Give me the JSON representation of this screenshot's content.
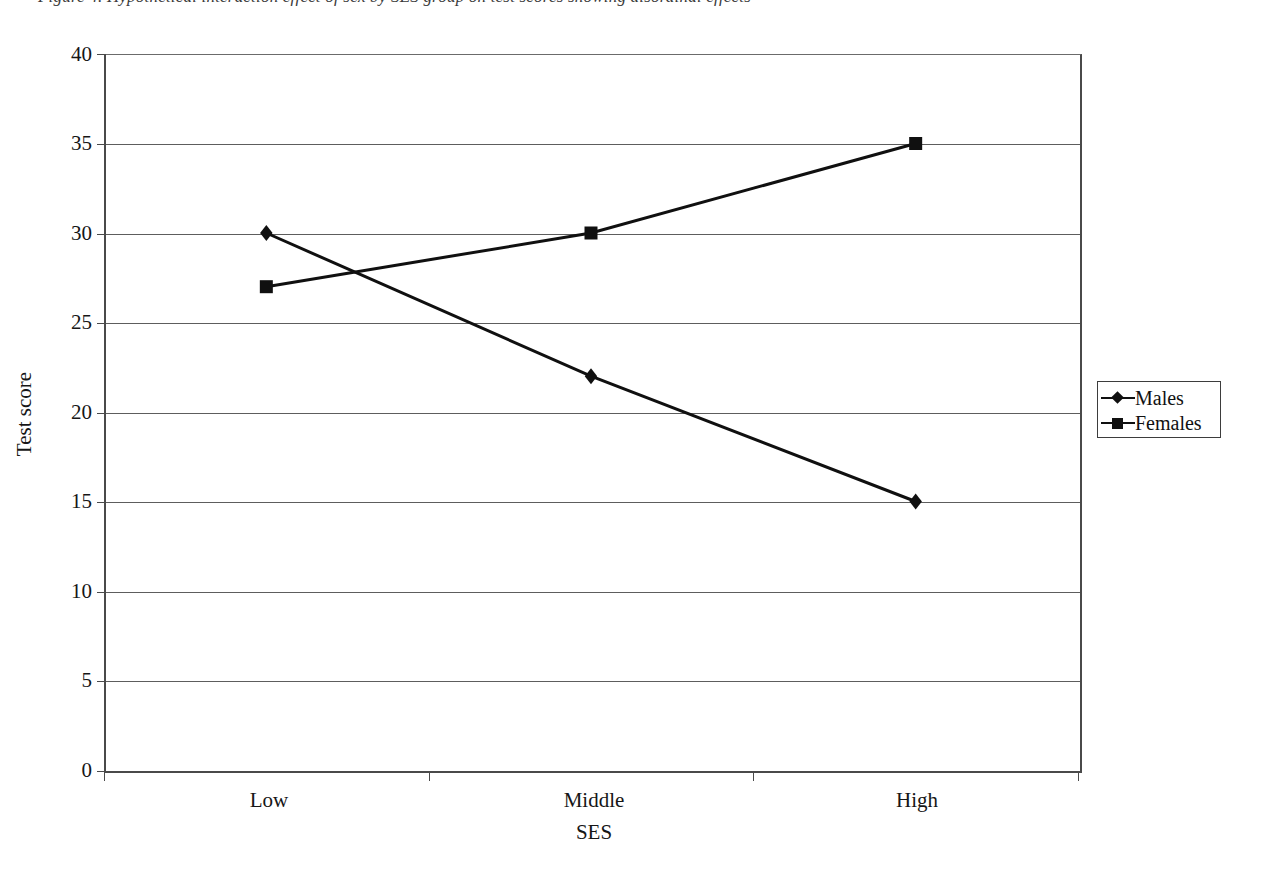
{
  "figure": {
    "top_caption_clipped": "Figure 4. Hypothetical interaction effect of sex by SES group on test scores showing disordinal effects"
  },
  "legend": {
    "position": "right",
    "entries": [
      {
        "label": "Males",
        "marker": "diamond-marker-icon",
        "color": "#101010"
      },
      {
        "label": "Females",
        "marker": "square-marker-icon",
        "color": "#101010"
      }
    ]
  },
  "chart_data": {
    "type": "line",
    "title": "",
    "xlabel": "SES",
    "ylabel": "Test score",
    "categories": [
      "Low",
      "Middle",
      "High"
    ],
    "series": [
      {
        "name": "Males",
        "values": [
          30,
          22,
          15
        ],
        "marker": "diamond",
        "color": "#101010"
      },
      {
        "name": "Females",
        "values": [
          27,
          30,
          35
        ],
        "marker": "square",
        "color": "#101010"
      }
    ],
    "ylim": [
      0,
      40
    ],
    "yticks": [
      0,
      5,
      10,
      15,
      20,
      25,
      30,
      35,
      40
    ],
    "ytick_labels": [
      "0",
      "5",
      "10",
      "15",
      "20",
      "25",
      "30",
      "35",
      "40"
    ],
    "grid": "horizontal",
    "legend_position": "right"
  }
}
